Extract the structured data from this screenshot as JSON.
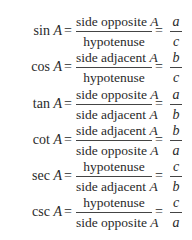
{
  "formulas": [
    {
      "func": "sin",
      "var": "A",
      "num": "side opposite",
      "num_var": "A",
      "den": "hypotenuse",
      "den_var": "",
      "r_num": "a",
      "r_den": "c"
    },
    {
      "func": "cos",
      "var": "A",
      "num": "side adjacent",
      "num_var": "A",
      "den": "hypotenuse",
      "den_var": "",
      "r_num": "b",
      "r_den": "c"
    },
    {
      "func": "tan",
      "var": "A",
      "num": "side opposite",
      "num_var": "A",
      "den": "side adjacent",
      "den_var": "A",
      "r_num": "a",
      "r_den": "b"
    },
    {
      "func": "cot",
      "var": "A",
      "num": "side adjacent",
      "num_var": "A",
      "den": "side opposite",
      "den_var": "A",
      "r_num": "b",
      "r_den": "a"
    },
    {
      "func": "sec",
      "var": "A",
      "num": "hypotenuse",
      "num_var": "",
      "den": "side adjacent",
      "den_var": "A",
      "r_num": "c",
      "r_den": "b"
    },
    {
      "func": "csc",
      "var": "A",
      "num": "hypotenuse",
      "num_var": "",
      "den": "side opposite",
      "den_var": "A",
      "r_num": "c",
      "r_den": "a"
    }
  ],
  "symbols": {
    "equals": "="
  }
}
